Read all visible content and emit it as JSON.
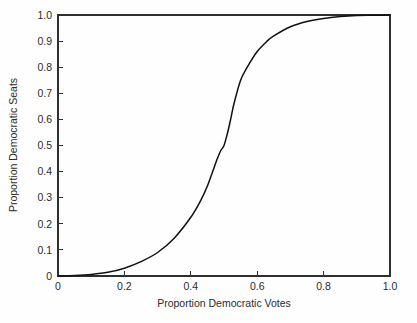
{
  "chart_data": {
    "type": "line",
    "title": "",
    "xlabel": "Proportion Democratic Votes",
    "ylabel": "Proportion Democratic Seats",
    "xlim": [
      0,
      1
    ],
    "ylim": [
      0,
      1
    ],
    "grid": false,
    "legend": false,
    "xticks": [
      0,
      0.2,
      0.4,
      0.6,
      0.8,
      1.0
    ],
    "xticklabels": [
      "0",
      "0.2",
      "0.4",
      "0.6",
      "0.8",
      "1.0"
    ],
    "yticks": [
      0,
      0.1,
      0.2,
      0.3,
      0.4,
      0.5,
      0.6,
      0.7,
      0.8,
      0.9,
      1.0
    ],
    "yticklabels": [
      "0",
      "0.1",
      "0.2",
      "0.3",
      "0.4",
      "0.5",
      "0.6",
      "0.7",
      "0.8",
      "0.9",
      "1.0"
    ],
    "series": [
      {
        "name": "seats-votes curve",
        "color": "#111111",
        "x": [
          0.0,
          0.05,
          0.1,
          0.15,
          0.2,
          0.25,
          0.3,
          0.35,
          0.4,
          0.43,
          0.45,
          0.47,
          0.48,
          0.49,
          0.5,
          0.51,
          0.52,
          0.53,
          0.55,
          0.57,
          0.6,
          0.63,
          0.65,
          0.7,
          0.75,
          0.8,
          0.85,
          0.9,
          0.95,
          1.0
        ],
        "y": [
          0.0,
          0.002,
          0.006,
          0.014,
          0.03,
          0.055,
          0.09,
          0.145,
          0.225,
          0.29,
          0.345,
          0.415,
          0.45,
          0.48,
          0.5,
          0.545,
          0.6,
          0.66,
          0.75,
          0.8,
          0.86,
          0.9,
          0.92,
          0.955,
          0.975,
          0.987,
          0.994,
          0.998,
          0.999,
          1.0
        ]
      }
    ]
  },
  "axes": {
    "x_title": "Proportion Democratic Votes",
    "y_title": "Proportion Democratic Seats"
  }
}
